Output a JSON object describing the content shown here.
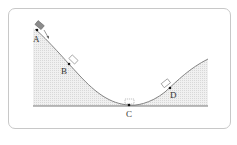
{
  "diagram": {
    "type": "physics-track",
    "points": [
      {
        "label": "A",
        "x": 37,
        "y": 30,
        "lx": 32,
        "ly": 42
      },
      {
        "label": "B",
        "x": 69,
        "y": 64,
        "lx": 61,
        "ly": 74
      },
      {
        "label": "C",
        "x": 129,
        "y": 105,
        "lx": 126,
        "ly": 117
      },
      {
        "label": "D",
        "x": 170,
        "y": 88,
        "lx": 170,
        "ly": 98
      }
    ],
    "colors": {
      "frame": "#c8c8c8",
      "curve": "#666666",
      "fill": "#e6e6e6",
      "block_A": "#8c8c8c",
      "block_outline": "#777777",
      "ground": "#555555"
    }
  }
}
